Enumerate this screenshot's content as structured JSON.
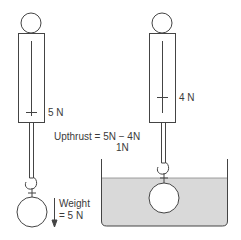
{
  "diagram": {
    "left_setup": {
      "spring_balance_reading": "5 N",
      "weight_label_line1": "Weight",
      "weight_label_line2": "= 5 N",
      "object_state": "in air"
    },
    "right_setup": {
      "spring_balance_reading": "4 N",
      "object_state": "submerged in water"
    },
    "upthrust_label_line1": "Upthrust = 5N − 4N",
    "upthrust_label_line2": "1N",
    "colors": {
      "stroke": "#444444",
      "water": "#d9d9d9",
      "background": "#ffffff",
      "object_fill": "#ffffff"
    }
  }
}
